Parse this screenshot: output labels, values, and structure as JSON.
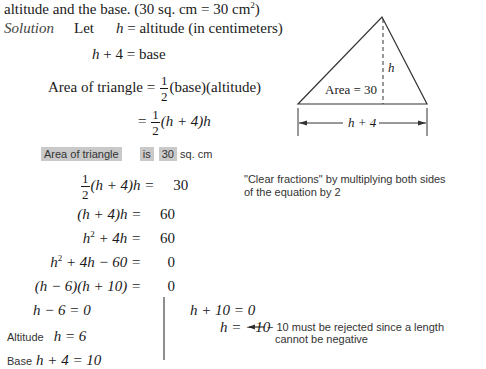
{
  "problem": {
    "header_line": "altitude and the base. (30 sq. cm = 30 cm",
    "header_sup": "2",
    "header_close": ")"
  },
  "solution": {
    "label": "Solution",
    "let_word": "Let",
    "let_stmt_var": "h",
    "let_stmt_rest": " = altitude (in centimeters)",
    "base_var": "h",
    "base_rest": " + 4 = base",
    "area_lhs": "Area of triangle = ",
    "area_num": "1",
    "area_den": "2",
    "area_rhs": "(base)(altitude)",
    "sub_eq": "= ",
    "sub_num": "1",
    "sub_den": "2",
    "sub_rhs": "(h + 4)h"
  },
  "diagram": {
    "area_label": "Area = 30",
    "height_label": "h",
    "base_label": "h + 4"
  },
  "translation": {
    "phrase1": "Area of triangle",
    "phrase2": "is",
    "phrase3": "30",
    "unit": "sq. cm"
  },
  "steps": [
    {
      "lhs_num": "1",
      "lhs_den": "2",
      "lhs": "(h + 4)h = ",
      "rhs": "30"
    },
    {
      "lhs": "(h + 4)h = ",
      "rhs": "60"
    },
    {
      "lhs_pre": "h",
      "lhs_sup": "2",
      "lhs_post": " + 4h = ",
      "rhs": "60"
    },
    {
      "lhs_pre": "h",
      "lhs_sup": "2",
      "lhs_post": " + 4h − 60 = ",
      "rhs": "0"
    },
    {
      "lhs": "(h − 6)(h + 10) = ",
      "rhs": "0"
    }
  ],
  "annotations": {
    "clear_fractions_line1": "\"Clear fractions\" by multiplying both sides",
    "clear_fractions_line2": "of the equation by 2",
    "reject_line1": "− 10 must be rejected since a length",
    "reject_line2": "cannot be negative"
  },
  "left_branch": {
    "eq1": "h − 6 = 0",
    "altitude_label": "Altitude",
    "altitude_eq": "h = 6",
    "base_label": "Base",
    "base_eq": "h + 4 = 10"
  },
  "right_branch": {
    "eq1": "h + 10 = 0",
    "eq2": "h = −10"
  },
  "colors": {
    "highlight": "#c9c9c9",
    "ink": "#1a1a1a",
    "note_ink": "#333333"
  }
}
